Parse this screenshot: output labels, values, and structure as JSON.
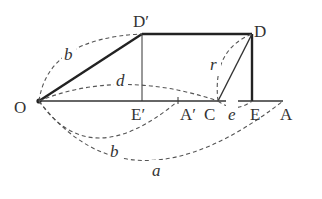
{
  "diagram": {
    "points": {
      "O": "O",
      "D_prime": "D′",
      "D": "D",
      "E_prime": "E′",
      "A_prime": "A′",
      "C": "C",
      "E": "E",
      "A": "A"
    },
    "variables": {
      "b_upper": "b",
      "d": "d",
      "r": "r",
      "e": "e",
      "b_lower": "b",
      "a": "a"
    },
    "colors": {
      "line": "#333333",
      "dashed": "#555555",
      "background": "#ffffff"
    }
  }
}
